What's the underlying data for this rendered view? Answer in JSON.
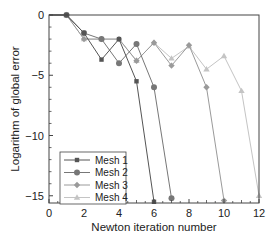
{
  "chart_data": {
    "type": "line",
    "title": "",
    "xlabel": "Newton iteration number",
    "ylabel": "Logarithm of global error",
    "xlim": [
      0,
      12
    ],
    "ylim": [
      -15.6,
      0
    ],
    "xticks": [
      0,
      2,
      4,
      6,
      8,
      10,
      12
    ],
    "yticks": [
      0,
      -5,
      -10,
      -15
    ],
    "xtick_labels": [
      "0",
      "2",
      "4",
      "6",
      "8",
      "10",
      "12"
    ],
    "ytick_labels": [
      "0",
      "−5",
      "−10",
      "−15"
    ],
    "grid": false,
    "legend_position": "lower left",
    "series": [
      {
        "name": "Mesh 1",
        "marker": "square",
        "color": "#555555",
        "x": [
          0,
          1,
          2,
          3,
          4,
          5,
          6
        ],
        "y": [
          0,
          0,
          -1.5,
          -3.7,
          -2.0,
          -5.5,
          -15.5
        ]
      },
      {
        "name": "Mesh 2",
        "marker": "circle",
        "color": "#777777",
        "x": [
          0,
          1,
          2,
          3,
          4,
          5,
          6,
          7
        ],
        "y": [
          0,
          0,
          -1.5,
          -2.0,
          -4.0,
          -2.4,
          -6.0,
          -15.2
        ]
      },
      {
        "name": "Mesh 3",
        "marker": "diamond",
        "color": "#9a9a9a",
        "x": [
          0,
          1,
          2,
          3,
          4,
          5,
          6,
          7,
          8,
          9,
          10
        ],
        "y": [
          0,
          0,
          -2.0,
          -2.0,
          -2.0,
          -3.8,
          -2.3,
          -4.2,
          -2.5,
          -6.0,
          -15.4
        ]
      },
      {
        "name": "Mesh 4",
        "marker": "triangle",
        "color": "#c4c4c4",
        "x": [
          0,
          1,
          2,
          3,
          4,
          5,
          6,
          7,
          8,
          9,
          10,
          11,
          12
        ],
        "y": [
          0,
          0,
          -2.0,
          -2.0,
          -2.0,
          -3.8,
          -2.3,
          -3.6,
          -2.6,
          -4.5,
          -3.4,
          -6.3,
          -15.0
        ]
      }
    ]
  }
}
